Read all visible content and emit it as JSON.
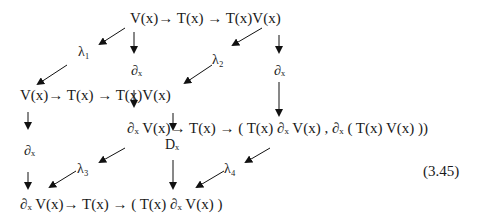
{
  "diagram": {
    "row_top": "V(x)→  T(x)  →  T(x)V(x)",
    "row_mid": "V(x)→  T(x)  →  T(x)V(x)",
    "row_inner": "∂ₓ V(x)→  T(x)  →  ( T(x) ∂ₓ V(x) , ∂ₓ ( T(x) V(x) ))",
    "row_bottom": "∂ₓ V(x)→  T(x)  →  ( T(x) ∂ₓ V(x) )",
    "labels": {
      "lambda1": "λ₁",
      "lambda2": "λ₂",
      "lambda3": "λ₃",
      "lambda4": "λ₄",
      "dx_top_left": "∂ₓ",
      "dx_top_right": "∂ₓ",
      "dx_left": "∂ₓ",
      "Dx": "Dₓ"
    },
    "equation_number": "(3.45)"
  }
}
